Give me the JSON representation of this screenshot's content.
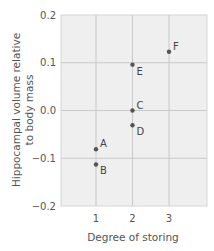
{
  "chart_data": {
    "type": "scatter",
    "title": "",
    "xlabel": "Degree of storing",
    "ylabel_lines": [
      "Hippocampal volume relative",
      "to body mass"
    ],
    "xlim": [
      0,
      4
    ],
    "ylim": [
      -0.2,
      0.2
    ],
    "xticks": [
      1,
      2,
      3
    ],
    "xtick_labels": [
      "1",
      "2",
      "3"
    ],
    "yticks": [
      0.2,
      0.1,
      0.0,
      -0.1,
      -0.2
    ],
    "ytick_labels": [
      "0.2",
      "0.1",
      "0.0",
      "−0.1",
      "−0.2"
    ],
    "grid": true,
    "legend": null,
    "points": [
      {
        "label": "A",
        "x": 1,
        "y": -0.081
      },
      {
        "label": "B",
        "x": 1,
        "y": -0.113
      },
      {
        "label": "C",
        "x": 2,
        "y": 0.0
      },
      {
        "label": "D",
        "x": 2,
        "y": -0.031
      },
      {
        "label": "E",
        "x": 2,
        "y": 0.096
      },
      {
        "label": "F",
        "x": 3,
        "y": 0.123
      }
    ]
  },
  "colors": {
    "plot_bg": "#efefef",
    "grid": "#c9c9c9",
    "frame": "#d6d6d6",
    "point": "#555555"
  }
}
